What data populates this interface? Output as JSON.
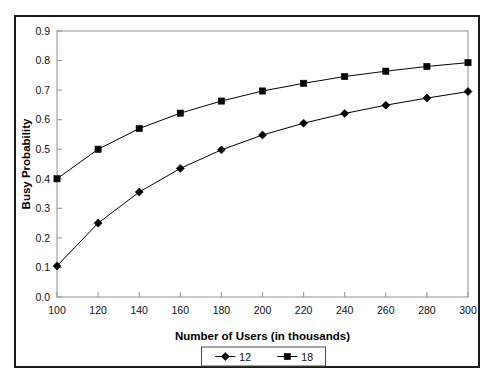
{
  "chart_data": {
    "type": "line",
    "title": "",
    "xlabel": "Number of Users (in thousands)",
    "ylabel": "Busy Probability",
    "x": [
      100,
      120,
      140,
      160,
      180,
      200,
      220,
      240,
      260,
      280,
      300
    ],
    "xtick_labels": [
      "100",
      "120",
      "140",
      "160",
      "180",
      "200",
      "220",
      "240",
      "260",
      "280",
      "300"
    ],
    "ytick_labels": [
      "0.0",
      "0.1",
      "0.2",
      "0.3",
      "0.4",
      "0.5",
      "0.6",
      "0.7",
      "0.8",
      "0.9"
    ],
    "xlim": [
      100,
      300
    ],
    "ylim": [
      0.0,
      0.9
    ],
    "grid": false,
    "legend_position": "bottom",
    "series": [
      {
        "name": "12",
        "marker": "diamond",
        "color": "#000000",
        "values": [
          0.105,
          0.25,
          0.355,
          0.435,
          0.498,
          0.548,
          0.588,
          0.621,
          0.649,
          0.673,
          0.695
        ]
      },
      {
        "name": "18",
        "marker": "square",
        "color": "#000000",
        "values": [
          0.4,
          0.5,
          0.57,
          0.622,
          0.663,
          0.697,
          0.723,
          0.746,
          0.764,
          0.78,
          0.793
        ]
      }
    ]
  },
  "axes": {
    "x_axis_title": "Number of Users (in thousands)",
    "y_axis_title": "Busy Probability"
  },
  "legend": {
    "items": [
      {
        "label": "12",
        "marker": "diamond"
      },
      {
        "label": "18",
        "marker": "square"
      }
    ]
  },
  "colors": {
    "frame": "#1a1a1a",
    "plot_border": "#9a9a9a",
    "series": "#000000",
    "background": "#ffffff"
  }
}
